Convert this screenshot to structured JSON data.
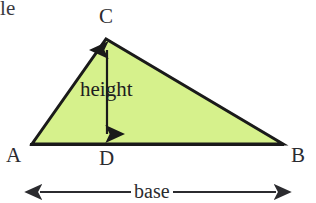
{
  "figure": {
    "partial_text_top_left": "le",
    "background_color": "#ffffff",
    "triangle": {
      "fill_color": "#d6f18c",
      "stroke_color": "#1a1a1a",
      "stroke_width": 3,
      "vertices": {
        "A": {
          "label": "A",
          "x": 32,
          "y": 144
        },
        "B": {
          "label": "B",
          "x": 283,
          "y": 144
        },
        "C": {
          "label": "C",
          "x": 106,
          "y": 39
        }
      },
      "foot_of_altitude": {
        "label": "D",
        "x": 107,
        "y": 144
      }
    },
    "labels": {
      "vertex_a": "A",
      "vertex_b": "B",
      "vertex_c": "C",
      "vertex_d": "D",
      "height": "height",
      "base": "base"
    },
    "height_arrow": {
      "name": "double-headed-vertical-arrow",
      "x": 107,
      "y_top": 41,
      "y_bottom": 143,
      "color": "#1a1a1a"
    },
    "base_arrow": {
      "name": "double-headed-horizontal-arrow",
      "y": 192,
      "x_left": 31,
      "x_right": 285,
      "color": "#2b2b2f"
    }
  }
}
